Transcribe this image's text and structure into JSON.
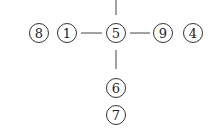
{
  "diagram": {
    "nodes": [
      {
        "id": "n8",
        "label": "8",
        "x": 39,
        "y": 33
      },
      {
        "id": "n1",
        "label": "1",
        "x": 67,
        "y": 33
      },
      {
        "id": "n5",
        "label": "5",
        "x": 116,
        "y": 33
      },
      {
        "id": "n9",
        "label": "9",
        "x": 163,
        "y": 33
      },
      {
        "id": "n4",
        "label": "4",
        "x": 193,
        "y": 33
      },
      {
        "id": "n6",
        "label": "6",
        "x": 116,
        "y": 88
      },
      {
        "id": "n7",
        "label": "7",
        "x": 116,
        "y": 115
      }
    ],
    "edges": [
      {
        "from": "top",
        "to": "n5"
      },
      {
        "from": "n1",
        "to": "n5"
      },
      {
        "from": "n5",
        "to": "n9"
      },
      {
        "from": "n5",
        "to": "n6"
      }
    ],
    "colors": {
      "stroke": "#333333",
      "text": "#222222",
      "background": "#ffffff"
    }
  }
}
